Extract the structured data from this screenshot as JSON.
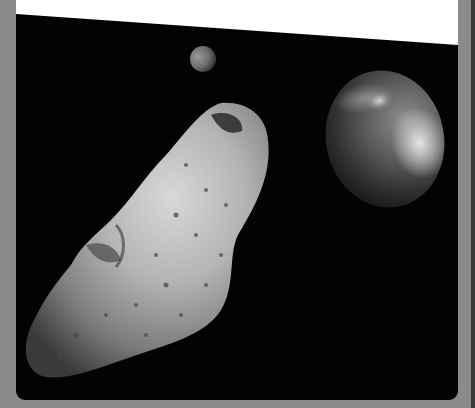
{
  "caption": {
    "visible_text_fragment": "",
    "note_truncated": true
  },
  "scene": {
    "subjects": [
      "asteroid",
      "earth",
      "moon"
    ],
    "palette": {
      "frame": "#8a8a8a",
      "space": "#030303",
      "caption_bg": "#ffffff"
    }
  }
}
